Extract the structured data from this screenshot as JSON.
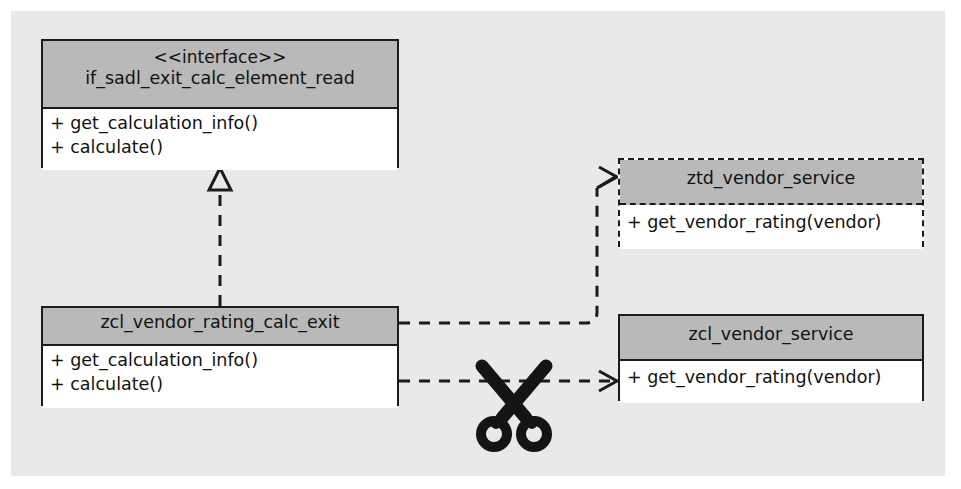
{
  "diagram": {
    "type": "uml-class-diagram",
    "background_color": "#e9e9e9",
    "header_fill": "#b9b9b9",
    "line_color": "#1b1b1b",
    "boxes": [
      {
        "id": "interface",
        "stereotype": "<<interface>>",
        "name": "if_sadl_exit_calc_element_read",
        "border_style": "solid",
        "members": [
          "+ get_calculation_info()",
          "+ calculate()"
        ]
      },
      {
        "id": "exit",
        "stereotype": "",
        "name": "zcl_vendor_rating_calc_exit",
        "border_style": "solid",
        "members": [
          "+ get_calculation_info()",
          "+ calculate()"
        ]
      },
      {
        "id": "ztd",
        "stereotype": "",
        "name": "ztd_vendor_service",
        "border_style": "dashed",
        "members": [
          "+ get_vendor_rating(vendor)"
        ]
      },
      {
        "id": "zcl",
        "stereotype": "",
        "name": "zcl_vendor_service",
        "border_style": "solid",
        "members": [
          "+ get_vendor_rating(vendor)"
        ]
      }
    ],
    "connectors": [
      {
        "id": "realization",
        "kind": "realization",
        "style": "dashed",
        "arrow": "hollow-triangle",
        "from": "zcl_vendor_rating_calc_exit",
        "to": "if_sadl_exit_calc_element_read"
      },
      {
        "id": "dependency-ztd",
        "kind": "dependency",
        "style": "dashed",
        "arrow": "open",
        "from": "zcl_vendor_rating_calc_exit",
        "to": "ztd_vendor_service"
      },
      {
        "id": "dependency-zcl",
        "kind": "dependency",
        "style": "dashed",
        "arrow": "open",
        "from": "zcl_vendor_rating_calc_exit",
        "to": "zcl_vendor_service",
        "annotation": "scissors-cut"
      }
    ],
    "annotations": [
      {
        "id": "scissors",
        "icon": "scissors-icon",
        "meaning": "cut-dependency"
      }
    ]
  }
}
